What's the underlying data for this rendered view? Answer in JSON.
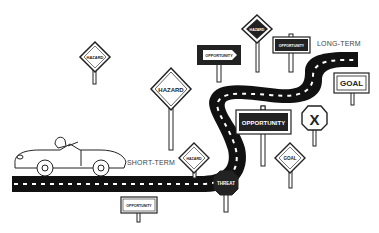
{
  "labels": {
    "short_term": "SHORT-TERM",
    "long_term": "LONG-TERM"
  },
  "signs": {
    "hazard_top_left": "HAZARD",
    "hazard_mid": "HAZARD",
    "hazard_top": "HAZARD",
    "hazard_road": "HAZARD",
    "opportunity_arrow": "OPPORTUNITY",
    "opportunity_top": "OPPORTUNITY",
    "opportunity_big": "OPPORTUNITY",
    "opportunity_bottom": "OPPORTUNITY",
    "goal_rect": "GOAL",
    "goal_diamond": "GOAL",
    "stop_x": "X",
    "threat": "THREAT"
  },
  "colors": {
    "road": "#111111",
    "ink": "#222222",
    "background": "#ffffff"
  }
}
